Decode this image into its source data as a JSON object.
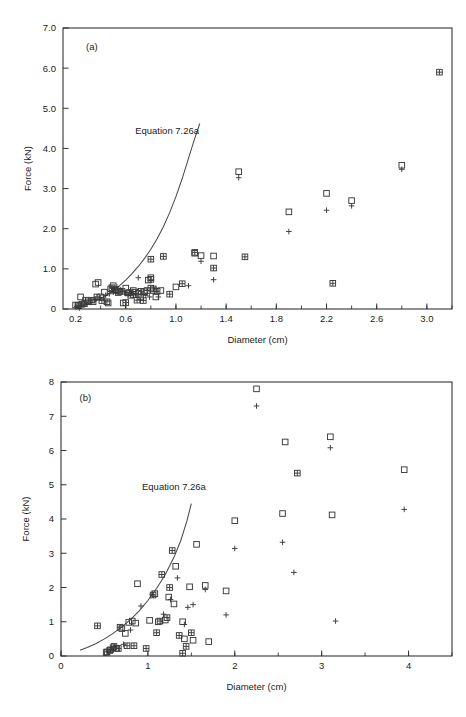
{
  "figure": {
    "panels": [
      {
        "id": "a",
        "panel_label": "(a)",
        "curve_label": "Equation 7.26a"
      },
      {
        "id": "b",
        "panel_label": "(b)",
        "curve_label": "Equation 7.26a"
      }
    ]
  },
  "chart_data": [
    {
      "type": "scatter",
      "title": "(a)",
      "xlabel": "Diameter (cm)",
      "ylabel": "Force (kN)",
      "xlim": [
        0.1,
        3.2
      ],
      "ylim": [
        0,
        7.0
      ],
      "xticks": [
        0.2,
        0.6,
        1.0,
        1.4,
        1.8,
        2.2,
        2.6,
        3.0
      ],
      "xtick_labels": [
        "0.2",
        "0.6",
        "1.0",
        "1.4",
        "1.8",
        "2.2",
        "2.6",
        "3.0"
      ],
      "xminor_step": 0.2,
      "yticks": [
        0,
        1.0,
        2.0,
        3.0,
        4.0,
        5.0,
        6.0,
        7.0
      ],
      "ytick_labels": [
        "0",
        "1.0",
        "2.0",
        "3.0",
        "4.0",
        "5.0",
        "6.0",
        "7.0"
      ],
      "grid": false,
      "legend": "none",
      "annotations": [
        {
          "text": "(a)",
          "x": 0.33,
          "y": 6.45
        },
        {
          "text": "Equation 7.26a",
          "x": 0.93,
          "y": 4.35
        }
      ],
      "curve": {
        "name": "Equation 7.26a",
        "points": [
          [
            0.2,
            0.03
          ],
          [
            0.25,
            0.07
          ],
          [
            0.3,
            0.12
          ],
          [
            0.35,
            0.18
          ],
          [
            0.4,
            0.26
          ],
          [
            0.45,
            0.35
          ],
          [
            0.5,
            0.46
          ],
          [
            0.55,
            0.58
          ],
          [
            0.6,
            0.72
          ],
          [
            0.65,
            0.88
          ],
          [
            0.7,
            1.06
          ],
          [
            0.75,
            1.26
          ],
          [
            0.8,
            1.49
          ],
          [
            0.85,
            1.75
          ],
          [
            0.9,
            2.05
          ],
          [
            0.95,
            2.4
          ],
          [
            1.0,
            2.8
          ],
          [
            1.05,
            3.25
          ],
          [
            1.1,
            3.75
          ],
          [
            1.15,
            4.25
          ],
          [
            1.19,
            4.62
          ]
        ]
      },
      "series": [
        {
          "name": "square",
          "marker": "square",
          "points": [
            [
              0.2,
              0.1
            ],
            [
              0.22,
              0.08
            ],
            [
              0.24,
              0.3
            ],
            [
              0.27,
              0.13
            ],
            [
              0.3,
              0.18
            ],
            [
              0.34,
              0.18
            ],
            [
              0.36,
              0.62
            ],
            [
              0.38,
              0.66
            ],
            [
              0.4,
              0.3
            ],
            [
              0.43,
              0.42
            ],
            [
              0.46,
              0.15
            ],
            [
              0.48,
              0.5
            ],
            [
              0.5,
              0.58
            ],
            [
              0.52,
              0.46
            ],
            [
              0.55,
              0.44
            ],
            [
              0.58,
              0.15
            ],
            [
              0.6,
              0.52
            ],
            [
              0.62,
              0.4
            ],
            [
              0.64,
              0.34
            ],
            [
              0.66,
              0.46
            ],
            [
              0.68,
              0.42
            ],
            [
              0.7,
              0.39
            ],
            [
              0.72,
              0.3
            ],
            [
              0.75,
              0.43
            ],
            [
              0.78,
              0.72
            ],
            [
              0.8,
              0.78
            ],
            [
              0.8,
              0.52
            ],
            [
              0.82,
              0.46
            ],
            [
              0.84,
              0.3
            ],
            [
              0.88,
              0.46
            ],
            [
              1.0,
              0.55
            ],
            [
              1.15,
              1.39
            ],
            [
              1.2,
              1.33
            ],
            [
              1.3,
              1.32
            ],
            [
              1.5,
              3.42
            ],
            [
              1.9,
              2.42
            ],
            [
              2.2,
              2.88
            ],
            [
              2.4,
              2.7
            ],
            [
              2.8,
              3.58
            ]
          ]
        },
        {
          "name": "plus",
          "marker": "plus",
          "points": [
            [
              0.21,
              0.06
            ],
            [
              0.23,
              0.02
            ],
            [
              0.26,
              0.1
            ],
            [
              0.29,
              0.14
            ],
            [
              0.32,
              0.2
            ],
            [
              0.36,
              0.24
            ],
            [
              0.4,
              0.28
            ],
            [
              0.44,
              0.34
            ],
            [
              0.47,
              0.38
            ],
            [
              0.5,
              0.42
            ],
            [
              0.53,
              0.55
            ],
            [
              0.56,
              0.48
            ],
            [
              0.59,
              0.4
            ],
            [
              0.62,
              0.36
            ],
            [
              0.65,
              0.44
            ],
            [
              0.68,
              0.38
            ],
            [
              0.7,
              0.78
            ],
            [
              0.73,
              0.36
            ],
            [
              0.76,
              0.34
            ],
            [
              0.79,
              0.3
            ],
            [
              0.86,
              0.3
            ],
            [
              1.1,
              0.58
            ],
            [
              1.2,
              1.19
            ],
            [
              1.3,
              0.73
            ],
            [
              1.5,
              3.27
            ],
            [
              1.9,
              1.93
            ],
            [
              2.2,
              2.46
            ],
            [
              2.4,
              2.57
            ],
            [
              2.8,
              3.48
            ]
          ]
        },
        {
          "name": "square-plus",
          "marker": "square-plus",
          "points": [
            [
              0.22,
              0.09
            ],
            [
              0.25,
              0.12
            ],
            [
              0.28,
              0.22
            ],
            [
              0.33,
              0.22
            ],
            [
              0.37,
              0.3
            ],
            [
              0.41,
              0.21
            ],
            [
              0.45,
              0.18
            ],
            [
              0.49,
              0.53
            ],
            [
              0.51,
              0.48
            ],
            [
              0.54,
              0.41
            ],
            [
              0.57,
              0.44
            ],
            [
              0.6,
              0.16
            ],
            [
              0.63,
              0.41
            ],
            [
              0.66,
              0.36
            ],
            [
              0.69,
              0.22
            ],
            [
              0.72,
              0.44
            ],
            [
              0.74,
              0.21
            ],
            [
              0.77,
              0.46
            ],
            [
              0.8,
              0.74
            ],
            [
              0.8,
              1.24
            ],
            [
              0.82,
              0.5
            ],
            [
              0.85,
              0.44
            ],
            [
              0.9,
              1.31
            ],
            [
              0.95,
              0.37
            ],
            [
              1.05,
              0.63
            ],
            [
              1.15,
              1.41
            ],
            [
              1.3,
              1.02
            ],
            [
              1.55,
              1.3
            ],
            [
              2.25,
              0.64
            ],
            [
              3.1,
              5.9
            ]
          ]
        }
      ]
    },
    {
      "type": "scatter",
      "title": "(b)",
      "xlabel": "Diameter (cm)",
      "ylabel": "Force (kN)",
      "xlim": [
        0,
        4.5
      ],
      "ylim": [
        0,
        8
      ],
      "xticks": [
        0,
        1,
        2,
        3,
        4
      ],
      "xtick_labels": [
        "0",
        "1",
        "2",
        "3",
        "4"
      ],
      "xminor_step": 0.5,
      "yticks": [
        0,
        1,
        2,
        3,
        4,
        5,
        6,
        7,
        8
      ],
      "ytick_labels": [
        "0",
        "1",
        "2",
        "3",
        "4",
        "5",
        "6",
        "7",
        "8"
      ],
      "grid": false,
      "legend": "none",
      "annotations": [
        {
          "text": "(b)",
          "x": 0.28,
          "y": 7.45
        },
        {
          "text": "Equation 7.26a",
          "x": 1.3,
          "y": 4.85
        }
      ],
      "curve": {
        "name": "Equation 7.26a",
        "points": [
          [
            0.22,
            0.17
          ],
          [
            0.3,
            0.25
          ],
          [
            0.4,
            0.36
          ],
          [
            0.5,
            0.5
          ],
          [
            0.6,
            0.66
          ],
          [
            0.7,
            0.85
          ],
          [
            0.8,
            1.06
          ],
          [
            0.9,
            1.32
          ],
          [
            1.0,
            1.62
          ],
          [
            1.1,
            1.97
          ],
          [
            1.2,
            2.38
          ],
          [
            1.3,
            2.88
          ],
          [
            1.38,
            3.38
          ],
          [
            1.45,
            3.95
          ],
          [
            1.5,
            4.45
          ]
        ]
      },
      "series": [
        {
          "name": "square",
          "marker": "square",
          "points": [
            [
              0.52,
              0.1
            ],
            [
              0.56,
              0.16
            ],
            [
              0.6,
              0.24
            ],
            [
              0.64,
              0.22
            ],
            [
              0.7,
              0.8
            ],
            [
              0.74,
              0.66
            ],
            [
              0.78,
              0.98
            ],
            [
              0.82,
              1.02
            ],
            [
              0.86,
              0.96
            ],
            [
              0.88,
              2.11
            ],
            [
              1.02,
              1.04
            ],
            [
              1.08,
              1.82
            ],
            [
              1.12,
              1.0
            ],
            [
              1.2,
              1.05
            ],
            [
              1.24,
              1.72
            ],
            [
              1.3,
              1.52
            ],
            [
              1.32,
              2.62
            ],
            [
              1.4,
              1.0
            ],
            [
              1.42,
              0.5
            ],
            [
              1.48,
              2.02
            ],
            [
              1.52,
              0.46
            ],
            [
              1.56,
              3.26
            ],
            [
              1.66,
              2.06
            ],
            [
              1.7,
              0.42
            ],
            [
              1.9,
              1.9
            ],
            [
              2.0,
              3.95
            ],
            [
              2.25,
              7.8
            ],
            [
              2.55,
              4.16
            ],
            [
              2.58,
              6.25
            ],
            [
              3.1,
              6.4
            ],
            [
              3.12,
              4.12
            ],
            [
              3.95,
              5.44
            ]
          ]
        },
        {
          "name": "plus",
          "marker": "plus",
          "points": [
            [
              0.54,
              0.14
            ],
            [
              0.58,
              0.2
            ],
            [
              0.62,
              0.26
            ],
            [
              0.72,
              0.34
            ],
            [
              0.8,
              0.76
            ],
            [
              0.92,
              1.46
            ],
            [
              1.05,
              1.8
            ],
            [
              1.18,
              1.22
            ],
            [
              1.26,
              1.65
            ],
            [
              1.34,
              2.28
            ],
            [
              1.42,
              0.92
            ],
            [
              1.46,
              1.42
            ],
            [
              1.52,
              1.5
            ],
            [
              1.66,
              1.94
            ],
            [
              1.9,
              1.2
            ],
            [
              2.0,
              3.14
            ],
            [
              2.25,
              7.3
            ],
            [
              2.55,
              3.32
            ],
            [
              2.68,
              2.44
            ],
            [
              3.1,
              6.08
            ],
            [
              3.16,
              1.02
            ],
            [
              3.95,
              4.28
            ]
          ]
        },
        {
          "name": "square-plus",
          "marker": "square-plus",
          "points": [
            [
              0.42,
              0.88
            ],
            [
              0.53,
              0.12
            ],
            [
              0.57,
              0.18
            ],
            [
              0.61,
              0.28
            ],
            [
              0.66,
              0.22
            ],
            [
              0.68,
              0.84
            ],
            [
              0.76,
              0.3
            ],
            [
              0.84,
              0.3
            ],
            [
              0.98,
              0.22
            ],
            [
              1.06,
              1.78
            ],
            [
              1.1,
              0.68
            ],
            [
              1.14,
              1.02
            ],
            [
              1.22,
              1.12
            ],
            [
              1.28,
              3.08
            ],
            [
              1.36,
              0.6
            ],
            [
              1.4,
              0.08
            ],
            [
              1.44,
              0.28
            ],
            [
              1.5,
              0.68
            ],
            [
              1.16,
              2.38
            ],
            [
              1.25,
              2.0
            ],
            [
              2.72,
              5.34
            ]
          ]
        }
      ]
    }
  ]
}
